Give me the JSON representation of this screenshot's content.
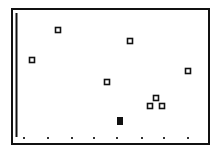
{
  "chart_data": {
    "type": "scatter",
    "title": "",
    "xlabel": "",
    "ylabel": "",
    "grid": false,
    "legend": null,
    "frame": {
      "x": 12,
      "y": 9,
      "width": 197,
      "height": 135
    },
    "y_axis_line": {
      "x": 16.5,
      "y1": 13,
      "y2": 137
    },
    "x_tick_dots": {
      "y": 138,
      "x": [
        24,
        48,
        72,
        94,
        117,
        142,
        164,
        188
      ]
    },
    "points": [
      {
        "x": 58,
        "y": 30,
        "marker": "hollow-square"
      },
      {
        "x": 32,
        "y": 60,
        "marker": "hollow-square"
      },
      {
        "x": 130,
        "y": 41,
        "marker": "hollow-square"
      },
      {
        "x": 107,
        "y": 82,
        "marker": "hollow-square"
      },
      {
        "x": 188,
        "y": 71,
        "marker": "hollow-square"
      },
      {
        "x": 156,
        "y": 98,
        "marker": "hollow-square"
      },
      {
        "x": 150,
        "y": 106,
        "marker": "hollow-square"
      },
      {
        "x": 162,
        "y": 106,
        "marker": "hollow-square"
      },
      {
        "x": 120,
        "y": 121,
        "marker": "filled-rect"
      }
    ],
    "colors": {
      "ink": "#111111",
      "background": "#ffffff"
    }
  }
}
